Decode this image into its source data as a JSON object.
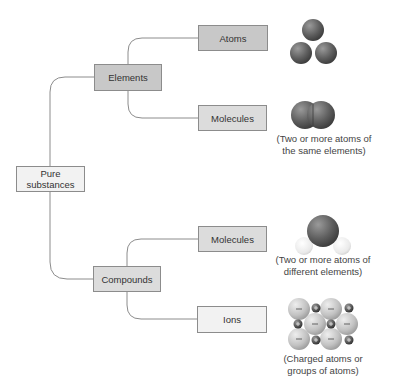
{
  "diagram": {
    "root": {
      "label": "Pure substances"
    },
    "categories": [
      {
        "label": "Elements",
        "children": [
          {
            "label": "Atoms",
            "illustration": "three-separate-atoms",
            "caption": []
          },
          {
            "label": "Molecules",
            "illustration": "diatomic-molecule",
            "caption": [
              "(Two or more atoms of",
              "the same elements)"
            ]
          }
        ]
      },
      {
        "label": "Compounds",
        "children": [
          {
            "label": "Molecules",
            "illustration": "water-molecule",
            "caption": [
              "(Two or more atoms of",
              "different elements)"
            ]
          },
          {
            "label": "Ions",
            "illustration": "ionic-lattice",
            "caption": [
              "(Charged atoms or",
              "groups of atoms)"
            ]
          }
        ]
      }
    ],
    "ion_signs": {
      "anion": "−",
      "cation": "+"
    }
  },
  "colors": {
    "line": "#8c8c8c",
    "box_dark": "#c8c8c8",
    "box_mid": "#dcdcdc",
    "box_light": "#f2f2f2",
    "atom_dark": "#5a5a5a",
    "anion": "#c4c4c4",
    "cation": "#4a4a4a"
  }
}
